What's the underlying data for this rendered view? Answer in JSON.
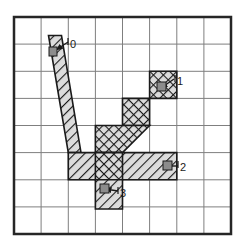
{
  "figure": {
    "title": "",
    "canvas": {
      "width": 244,
      "height": 250,
      "background": "#ffffff"
    },
    "grid": {
      "name": "8x8-cell-grid",
      "columns": 8,
      "rows": 8,
      "x0": 14,
      "y0": 17,
      "cell_width": 27.125,
      "cell_height": 27.125,
      "inner_line_color": "#7a7a7a",
      "inner_line_width": 1,
      "border_color": "#262626",
      "border_width": 2.5
    },
    "region": {
      "name": "hatched-branching-region",
      "fill_color": "#d9d9d9",
      "outline_color": "#1a1a1a",
      "outline_width": 1.6,
      "hatch_color": "#1a1a1a",
      "hatch_angle_deg": 45,
      "hatch_spacing_px": 5,
      "crosshatch_angle_deg": 135,
      "description": "tree-like branching band with four leaf endpoints"
    },
    "labels": [
      {
        "id": "label-0",
        "text": "0",
        "text_x": 64,
        "text_y": 47,
        "arrow_from_x": 70,
        "arrow_from_y": 45,
        "arrow_to_x": 54,
        "arrow_to_y": 52,
        "marker_x": 54,
        "marker_y": 52
      },
      {
        "id": "label-1",
        "text": "1",
        "text_x": 170,
        "text_y": 84,
        "arrow_from_x": 176,
        "arrow_from_y": 80,
        "arrow_to_x": 159,
        "arrow_to_y": 88,
        "marker_x": 159,
        "marker_y": 88
      },
      {
        "id": "label-2",
        "text": "2",
        "text_x": 172,
        "text_y": 171,
        "arrow_from_x": 178,
        "arrow_from_y": 166,
        "arrow_to_x": 160,
        "arrow_to_y": 166,
        "marker_x": 166,
        "marker_y": 166
      },
      {
        "id": "label-3",
        "text": "3",
        "text_x": 113,
        "text_y": 197,
        "arrow_from_x": 119,
        "arrow_from_y": 192,
        "arrow_to_x": 101,
        "arrow_to_y": 190,
        "marker_x": 104,
        "marker_y": 190
      }
    ],
    "shapes": {
      "branch_0_tube": "M 49,36 L 61,36 L 79,155 L 67,155 Z",
      "branch_1_tube": "M 150,68 L 177,68 L 177,95 L 150,95 Z",
      "branch_1_elbow": "M 123,95 L 150,95 L 150,122 L 123,122 Z",
      "branch_1_diag": "M 150,95 L 123,122 L 123,95 Z",
      "trunk_upper": "M 96,122 L 123,122 L 123,155 L 96,155 Z",
      "horizontal_band": "M 77,155 L 177,155 L 177,182 L 77,182 Z",
      "branch_3_stem": "M 96,182 L 123,182 L 123,210 L 96,210 Z"
    }
  }
}
